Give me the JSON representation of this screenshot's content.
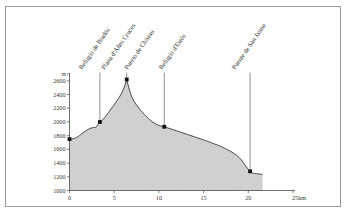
{
  "figure": {
    "kind": "elevation-profile",
    "frame_color": "#9a9a9a",
    "background": "#ffffff"
  },
  "chart_data": {
    "type": "area",
    "title": "",
    "subtitle": "",
    "xlabel": "",
    "ylabel": "",
    "x_unit": "km",
    "y_unit": "m",
    "xlim": [
      0,
      25
    ],
    "ylim": [
      1000,
      2700
    ],
    "grid": false,
    "legend": null,
    "x_ticks": [
      0,
      5,
      10,
      15,
      20,
      25
    ],
    "x_tick_labels": [
      "0",
      "5",
      "10",
      "15",
      "20",
      "25km"
    ],
    "y_ticks": [
      1000,
      1200,
      1400,
      1600,
      1800,
      2000,
      2200,
      2400,
      2600
    ],
    "y_tick_labels": [
      "1000",
      "1200",
      "1400",
      "1600",
      "1800",
      "2000",
      "2200",
      "2400",
      "2600"
    ],
    "fill_color": "#d2d2d2",
    "line_color": "#333333",
    "marker_color": "#111111",
    "series": [
      {
        "name": "elevation",
        "x": [
          0.0,
          0.55,
          1.1,
          1.7,
          2.3,
          2.75,
          3.0,
          3.4,
          3.7,
          4.2,
          4.7,
          5.2,
          5.7,
          6.1,
          6.4,
          6.75,
          7.1,
          7.6,
          8.1,
          8.6,
          9.1,
          9.6,
          10.1,
          10.6,
          11.3,
          12.0,
          12.8,
          13.6,
          14.4,
          15.2,
          16.0,
          16.8,
          17.6,
          18.4,
          19.2,
          20.2,
          21.0,
          21.6
        ],
        "y": [
          1750,
          1760,
          1800,
          1860,
          1905,
          1920,
          1930,
          2000,
          2030,
          2110,
          2200,
          2290,
          2390,
          2500,
          2620,
          2450,
          2330,
          2230,
          2150,
          2080,
          2020,
          1975,
          1945,
          1930,
          1900,
          1870,
          1835,
          1800,
          1765,
          1730,
          1690,
          1650,
          1600,
          1540,
          1450,
          1280,
          1245,
          1235
        ]
      }
    ],
    "markers": [
      {
        "label": "Refugio de Biadós",
        "x": 0.0,
        "y": 1750
      },
      {
        "label": "Plana d'Añes Cruces",
        "x": 3.4,
        "y": 2000
      },
      {
        "label": "Puerto de Chistau",
        "x": 6.4,
        "y": 2620
      },
      {
        "label": "Refugio d'Estós",
        "x": 10.6,
        "y": 1930
      },
      {
        "label": "Puente de San Jaime",
        "x": 20.2,
        "y": 1280
      }
    ],
    "annotations": [
      {
        "name": "Refugio de Biadós",
        "leader_x": 3.4,
        "leader_top_y": 2720,
        "leader_bottom_y": 2000
      },
      {
        "name": "Plana d'Añes Cruces",
        "leader_x": 6.4,
        "leader_top_y": 2720,
        "leader_bottom_y": 2620
      },
      {
        "name": "Puerto de Chistau",
        "leader_x": 10.6,
        "leader_top_y": 2720,
        "leader_bottom_y": 1930
      },
      {
        "name": "Refugio d'Estós",
        "leader_x": 20.2,
        "leader_top_y": 2720,
        "leader_bottom_y": 1280
      }
    ]
  },
  "waypoint_labels": [
    "Refugio de Biadós",
    "Plana d'Añes Cruces",
    "Puerto de Chistau",
    "Refugio d'Estós",
    "Puente de San Jaime"
  ],
  "axis_unit_marks": {
    "y_unit": "m",
    "x_last_label": "25km"
  }
}
